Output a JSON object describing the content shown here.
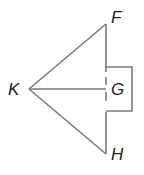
{
  "diagram": {
    "type": "geometry",
    "vertices": {
      "F": {
        "label": "F",
        "x": 106,
        "y": 24
      },
      "K": {
        "label": "K",
        "x": 29,
        "y": 89
      },
      "G": {
        "label": "G",
        "x": 106,
        "y": 89
      },
      "H": {
        "label": "H",
        "x": 106,
        "y": 154
      }
    },
    "segments": [
      "KF",
      "KH",
      "FH",
      "KG"
    ],
    "box": {
      "x1": 106,
      "y1": 67,
      "x2": 132,
      "y2": 111
    },
    "colors": {
      "stroke": "#7a7a7a",
      "text": "#222222",
      "background": "#ffffff"
    }
  },
  "labels": {
    "F": "F",
    "K": "K",
    "G": "G",
    "H": "H"
  }
}
